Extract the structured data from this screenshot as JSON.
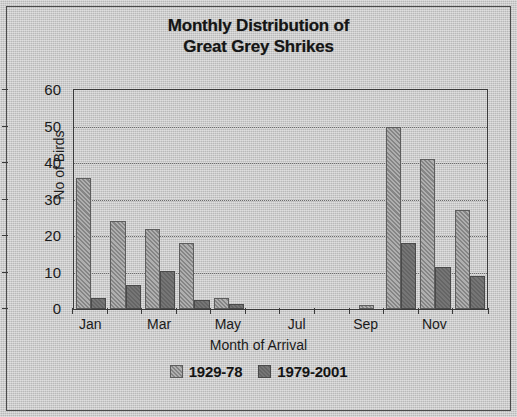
{
  "chart_data": {
    "type": "bar",
    "title": "Monthly Distribution of Great Grey Shrikes",
    "title_line1": "Monthly Distribution of",
    "title_line2": "Great Grey Shrikes",
    "xlabel": "Month of Arrival",
    "ylabel": "No of Birds",
    "ylim": [
      0,
      60
    ],
    "ytick_step": 10,
    "yticks": [
      60,
      50,
      40,
      30,
      20,
      10,
      0
    ],
    "grid": true,
    "legend_position": "bottom",
    "categories": [
      "Jan",
      "Feb",
      "Mar",
      "Apr",
      "May",
      "Jun",
      "Jul",
      "Aug",
      "Sep",
      "Oct",
      "Nov",
      "Dec"
    ],
    "tick_labels_shown": [
      "Jan",
      "",
      "Mar",
      "",
      "May",
      "",
      "Jul",
      "",
      "Sep",
      "",
      "Nov",
      ""
    ],
    "series": [
      {
        "name": "1929-78",
        "color": "#8d8d8d",
        "values": [
          36,
          24,
          22,
          18,
          3,
          0,
          0,
          0,
          1,
          50,
          41,
          27
        ]
      },
      {
        "name": "1979-2001",
        "color": "#6a6a6a",
        "values": [
          3,
          6.5,
          10.5,
          2.5,
          1.5,
          0,
          0,
          0,
          0,
          18,
          11.5,
          9
        ]
      }
    ]
  },
  "legend": {
    "items": [
      {
        "label": "1929-78"
      },
      {
        "label": "1979-2001"
      }
    ]
  }
}
